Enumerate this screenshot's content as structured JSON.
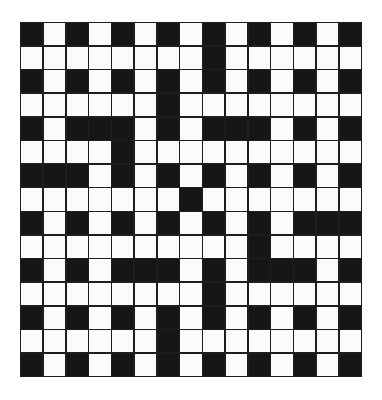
{
  "puzzle": {
    "rows": 15,
    "cols": 15,
    "colors": {
      "block": "#161616",
      "open": "#fbfbfb",
      "line": "#1e1e1e"
    },
    "grid": [
      "#.#.#.#.#.#.#.#",
      "........#......",
      "#.#.#.#.#.#.#.#",
      "......#........",
      "#.###.#.###.#.#",
      "....#..........",
      "###.#.#.#.#.#.#",
      ".......#.......",
      "#.#.#.#.#.#.###",
      "..........#....",
      "#.#.###.#.###.#",
      "........#......",
      "#.#.#.#.#.#.#.#",
      "......#........",
      "#.#.#.#.#.#.#.#"
    ]
  }
}
